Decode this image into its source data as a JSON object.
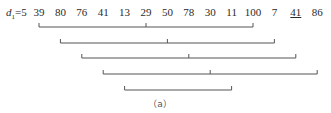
{
  "diagram": {
    "increment_label": {
      "var": "d",
      "sub": "1",
      "value": "=5"
    },
    "sequence": [
      "39",
      "80",
      "76",
      "41",
      "13",
      "29",
      "50",
      "78",
      "30",
      "11",
      "100",
      "7",
      "41",
      "86"
    ],
    "underlined_index": 12,
    "caption": "（a）",
    "groups": [
      {
        "indices": [
          0,
          5,
          10
        ],
        "values": [
          "39",
          "29",
          "100"
        ]
      },
      {
        "indices": [
          1,
          6,
          11
        ],
        "values": [
          "80",
          "50",
          "7"
        ]
      },
      {
        "indices": [
          2,
          7,
          12
        ],
        "values": [
          "76",
          "78",
          "41"
        ]
      },
      {
        "indices": [
          3,
          8,
          13
        ],
        "values": [
          "41",
          "30",
          "86"
        ]
      },
      {
        "indices": [
          4,
          9
        ],
        "values": [
          "13",
          "11"
        ]
      }
    ],
    "line_color": "#555555"
  }
}
